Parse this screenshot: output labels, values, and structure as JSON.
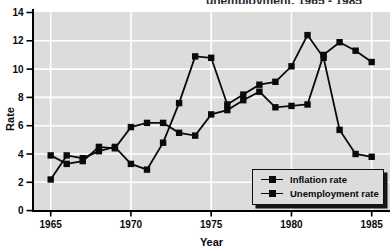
{
  "title_clipped": "unemployment, 1965 - 1985",
  "axes": {
    "y_label": "Rate",
    "x_label": "Year",
    "y_ticks": [
      0,
      2,
      4,
      6,
      8,
      10,
      12,
      14
    ],
    "x_ticks": [
      1965,
      1970,
      1975,
      1980,
      1985
    ]
  },
  "legend": {
    "items": [
      {
        "label": "Inflation rate"
      },
      {
        "label": "Unemployment rate"
      }
    ]
  },
  "chart_data": {
    "type": "line",
    "xlabel": "Year",
    "ylabel": "Rate",
    "x": [
      1965,
      1966,
      1967,
      1968,
      1969,
      1970,
      1971,
      1972,
      1973,
      1974,
      1975,
      1976,
      1977,
      1978,
      1979,
      1980,
      1981,
      1982,
      1983,
      1984,
      1985
    ],
    "series": [
      {
        "name": "Inflation rate",
        "values": [
          2.2,
          3.9,
          3.7,
          4.2,
          4.5,
          3.3,
          2.9,
          4.8,
          7.6,
          10.9,
          10.8,
          7.5,
          8.2,
          8.9,
          9.1,
          10.2,
          12.4,
          10.8,
          5.7,
          4.0,
          3.8
        ]
      },
      {
        "name": "Unemployment rate",
        "values": [
          3.9,
          3.3,
          3.5,
          4.5,
          4.4,
          5.9,
          6.2,
          6.2,
          5.5,
          5.3,
          6.8,
          7.1,
          7.8,
          8.4,
          7.3,
          7.4,
          7.5,
          11.0,
          11.9,
          11.3,
          10.5
        ]
      }
    ],
    "xlim": [
      1963.9,
      1986.2
    ],
    "ylim": [
      0,
      14
    ],
    "grid": true,
    "legend_position": "lower right",
    "marker": "filled-square",
    "colors": {
      "line": "#0a0a0a",
      "marker": "#0a0a0a",
      "plot_bg": "#dcdcdc",
      "grid": "#ffffff",
      "axis": "#000000",
      "text": "#0a0a0a"
    }
  }
}
